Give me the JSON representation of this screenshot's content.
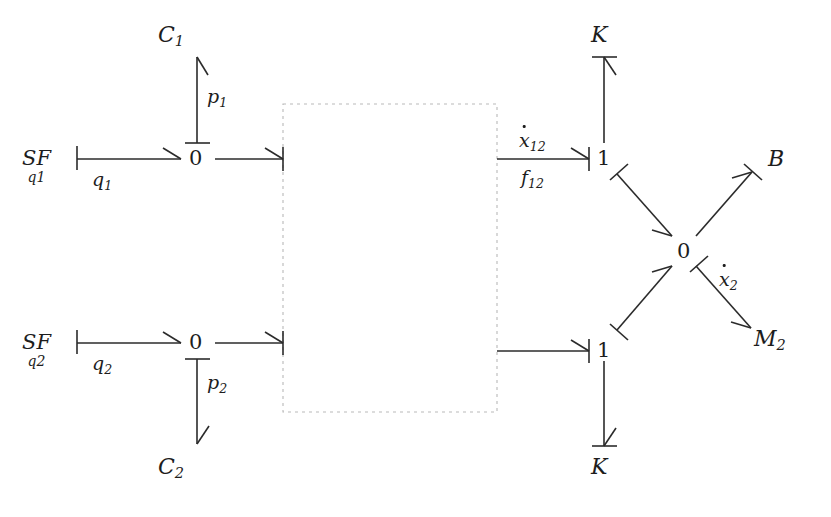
{
  "diagram": {
    "type": "bond-graph",
    "background_color": "#ffffff",
    "line_color": "#2b2b2b",
    "dashed_box_color": "#b9b9b9"
  },
  "sources": [
    {
      "id": "sf1",
      "label": "SF",
      "subscript": "q1",
      "x": 28,
      "y": 150
    },
    {
      "id": "sf2",
      "label": "SF",
      "subscript": "q2",
      "x": 28,
      "y": 333
    }
  ],
  "junctions": [
    {
      "id": "zero-top-left",
      "label": "0",
      "x": 195,
      "y": 153
    },
    {
      "id": "zero-bottom-left",
      "label": "0",
      "x": 195,
      "y": 337
    },
    {
      "id": "one-top-right",
      "label": "1",
      "x": 601,
      "y": 153
    },
    {
      "id": "zero-center-right",
      "label": "0",
      "x": 683,
      "y": 249
    },
    {
      "id": "one-bottom-right",
      "label": "1",
      "x": 601,
      "y": 345
    }
  ],
  "elements": [
    {
      "id": "c1",
      "label": "C",
      "subscript": "1",
      "x": 160,
      "y": 26
    },
    {
      "id": "c2",
      "label": "C",
      "subscript": "2",
      "x": 160,
      "y": 458
    },
    {
      "id": "k-top",
      "label": "K",
      "subscript": "",
      "x": 589,
      "y": 26
    },
    {
      "id": "k-bottom",
      "label": "K",
      "subscript": "",
      "x": 589,
      "y": 460
    },
    {
      "id": "b-damper",
      "label": "B",
      "subscript": "",
      "x": 769,
      "y": 152
    },
    {
      "id": "m2-mass",
      "label": "M",
      "subscript": "2",
      "x": 757,
      "y": 330
    }
  ],
  "bond_labels": [
    {
      "id": "q1-label",
      "text": "q",
      "subscript": "1",
      "dot": false,
      "x": 94,
      "y": 172
    },
    {
      "id": "q2-label",
      "text": "q",
      "subscript": "2",
      "dot": false,
      "x": 94,
      "y": 356
    },
    {
      "id": "p1-label",
      "text": "p",
      "subscript": "1",
      "dot": false,
      "x": 207,
      "y": 89
    },
    {
      "id": "p2-label",
      "text": "p",
      "subscript": "2",
      "dot": false,
      "x": 207,
      "y": 375
    },
    {
      "id": "xdot12-label",
      "text": "x",
      "subscript": "12",
      "dot": true,
      "x": 520,
      "y": 133
    },
    {
      "id": "f12-label",
      "text": "f",
      "subscript": "12",
      "dot": false,
      "x": 521,
      "y": 170
    },
    {
      "id": "xdot2-label",
      "text": "x",
      "subscript": "2",
      "dot": true,
      "x": 720,
      "y": 272
    }
  ],
  "dashed_box": {
    "id": "transformer-region",
    "x": 283,
    "y": 104,
    "width": 214,
    "height": 308
  },
  "bonds": [
    {
      "id": "sf1-to-zero1",
      "from": "sf1",
      "to": "zero-top-left",
      "label": "q1",
      "causality_end": "source",
      "arrow_end": "to"
    },
    {
      "id": "zero1-to-box",
      "from": "zero-top-left",
      "to": "transformer-region",
      "label": "",
      "causality_end": "to",
      "arrow_end": "to"
    },
    {
      "id": "zero1-to-c1",
      "from": "zero-top-left",
      "to": "c1",
      "label": "p1",
      "causality_end": "from",
      "arrow_end": "to"
    },
    {
      "id": "sf2-to-zero2",
      "from": "sf2",
      "to": "zero-bottom-left",
      "label": "q2",
      "causality_end": "source",
      "arrow_end": "to"
    },
    {
      "id": "zero2-to-box",
      "from": "zero-bottom-left",
      "to": "transformer-region",
      "label": "",
      "causality_end": "to",
      "arrow_end": "to"
    },
    {
      "id": "zero2-to-c2",
      "from": "zero-bottom-left",
      "to": "c2",
      "label": "p2",
      "causality_end": "from",
      "arrow_end": "to"
    },
    {
      "id": "box-to-one-top",
      "from": "transformer-region",
      "to": "one-top-right",
      "label": "xdot12 / f12",
      "causality_end": "to",
      "arrow_end": "to"
    },
    {
      "id": "box-to-one-bottom",
      "from": "transformer-region",
      "to": "one-bottom-right",
      "label": "",
      "causality_end": "to",
      "arrow_end": "to"
    },
    {
      "id": "one-top-to-k",
      "from": "one-top-right",
      "to": "k-top",
      "label": "",
      "causality_end": "to",
      "arrow_end": "to"
    },
    {
      "id": "one-bottom-to-k",
      "from": "one-bottom-right",
      "to": "k-bottom",
      "label": "",
      "causality_end": "to",
      "arrow_end": "to"
    },
    {
      "id": "one-top-to-zero-center",
      "from": "one-top-right",
      "to": "zero-center-right",
      "label": "",
      "causality_end": "from",
      "arrow_end": "to"
    },
    {
      "id": "one-bottom-to-zero-center",
      "from": "one-bottom-right",
      "to": "zero-center-right",
      "label": "",
      "causality_end": "from",
      "arrow_end": "to"
    },
    {
      "id": "zero-center-to-b",
      "from": "zero-center-right",
      "to": "b-damper",
      "label": "",
      "causality_end": "to",
      "arrow_end": "to"
    },
    {
      "id": "zero-center-to-m2",
      "from": "zero-center-right",
      "to": "m2-mass",
      "label": "xdot2",
      "causality_end": "from",
      "arrow_end": "to"
    }
  ]
}
